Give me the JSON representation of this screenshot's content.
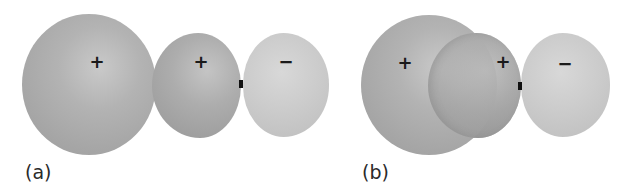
{
  "figure": {
    "panels": [
      {
        "id": "a",
        "label": "(a)",
        "lobes": [
          {
            "name": "s-orbital",
            "sign": "+"
          },
          {
            "name": "p-orbital-positive-lobe",
            "sign": "+"
          },
          {
            "name": "p-orbital-negative-lobe",
            "sign": "−"
          }
        ]
      },
      {
        "id": "b",
        "label": "(b)",
        "lobes": [
          {
            "name": "s-orbital",
            "sign": "+"
          },
          {
            "name": "p-orbital-positive-lobe",
            "sign": "+"
          },
          {
            "name": "p-orbital-negative-lobe",
            "sign": "−"
          }
        ]
      }
    ],
    "colors": {
      "s_lobe": "#b3b3b3",
      "positive_lobe": "#adadad",
      "negative_lobe": "#cccccc",
      "nucleus": "#111111",
      "text": "#1a1a1a"
    }
  }
}
